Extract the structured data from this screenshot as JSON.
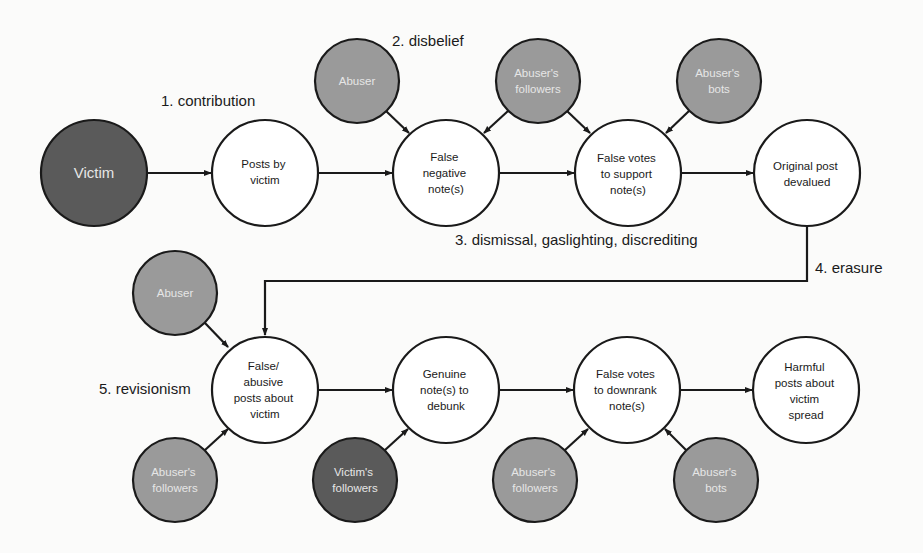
{
  "colors": {
    "background": "#fbfbfa",
    "stroke": "#1a1a1a",
    "white_node": "#ffffff",
    "actor_node": "#9a9a9a",
    "victim_node": "#5a5a5a",
    "actor_text": "#e6e6e6",
    "node_text": "#1a1a1a"
  },
  "steps": {
    "s1": "1. contribution",
    "s2": "2. disbelief",
    "s3": "3. dismissal, gaslighting, discrediting",
    "s4": "4. erasure",
    "s5": "5. revisionism"
  },
  "nodes": {
    "victim": {
      "lines": [
        "Victim"
      ]
    },
    "posts_by_victim": {
      "lines": [
        "Posts by",
        "victim"
      ]
    },
    "abuser_top": {
      "lines": [
        "Abuser"
      ]
    },
    "false_negative_notes": {
      "lines": [
        "False",
        "negative",
        "note(s)"
      ]
    },
    "abusers_followers_top": {
      "lines": [
        "Abuser's",
        "followers"
      ]
    },
    "false_votes_support": {
      "lines": [
        "False votes",
        "to support",
        "note(s)"
      ]
    },
    "abusers_bots_top": {
      "lines": [
        "Abuser's",
        "bots"
      ]
    },
    "original_post_devalued": {
      "lines": [
        "Original post",
        "devalued"
      ]
    },
    "abuser_bottom": {
      "lines": [
        "Abuser"
      ]
    },
    "false_abusive_posts": {
      "lines": [
        "False/",
        "abusive",
        "posts about",
        "victim"
      ]
    },
    "abusers_followers_left": {
      "lines": [
        "Abuser's",
        "followers"
      ]
    },
    "genuine_notes": {
      "lines": [
        "Genuine",
        "note(s) to",
        "debunk"
      ]
    },
    "victims_followers": {
      "lines": [
        "Victim's",
        "followers"
      ]
    },
    "false_votes_downrank": {
      "lines": [
        "False votes",
        "to downrank",
        "note(s)"
      ]
    },
    "abusers_followers_bottom": {
      "lines": [
        "Abuser's",
        "followers"
      ]
    },
    "abusers_bots_bottom": {
      "lines": [
        "Abuser's",
        "bots"
      ]
    },
    "harmful_posts_spread": {
      "lines": [
        "Harmful",
        "posts about",
        "victim",
        "spread"
      ]
    }
  }
}
